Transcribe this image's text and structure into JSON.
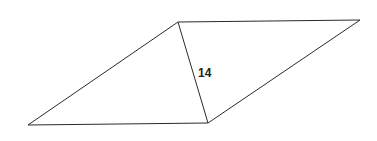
{
  "diagram": {
    "shape": "parallelogram",
    "vertices": {
      "top_left": [
        178,
        22
      ],
      "top_right": [
        360,
        20
      ],
      "bottom_right": [
        208,
        123
      ],
      "bottom_left": [
        28,
        125
      ]
    },
    "diagonal": {
      "from": "top_left",
      "to": "bottom_right",
      "label": "14"
    },
    "colors": {
      "stroke": "#2a2a2a",
      "label": "#222222",
      "background": "#ffffff"
    }
  }
}
